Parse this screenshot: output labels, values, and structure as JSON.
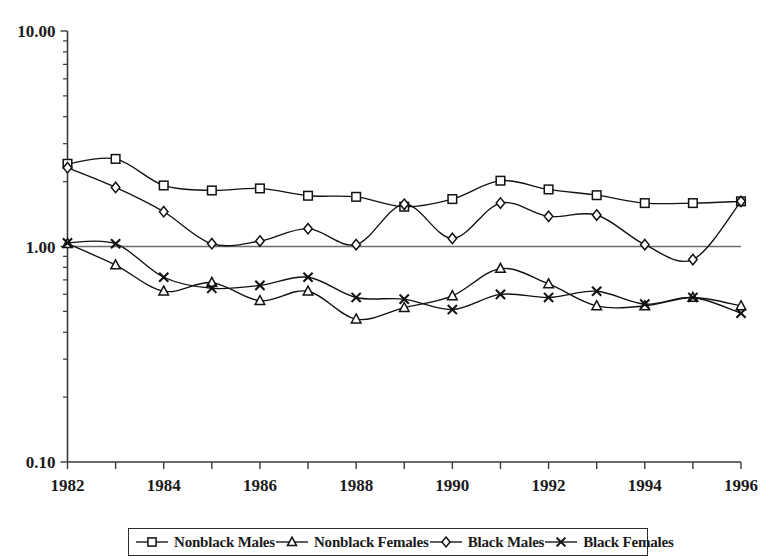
{
  "chart_data": {
    "type": "line",
    "title": "",
    "subtitle": "",
    "xlabel": "",
    "ylabel": "",
    "yscale": "log",
    "ylim": [
      0.1,
      10.0
    ],
    "ytick_labels": [
      "10.00",
      "1.00",
      "0.10"
    ],
    "ytick_values": [
      10.0,
      1.0,
      0.1
    ],
    "grid": false,
    "reference_line": 1.0,
    "legend_position": "bottom",
    "x": [
      1982,
      1983,
      1984,
      1985,
      1986,
      1987,
      1988,
      1989,
      1990,
      1991,
      1992,
      1993,
      1994,
      1995,
      1996
    ],
    "xtick_labels": [
      "1982",
      "1984",
      "1986",
      "1988",
      "1990",
      "1992",
      "1994",
      "1996"
    ],
    "xtick_values": [
      1982,
      1984,
      1986,
      1988,
      1990,
      1992,
      1994,
      1996
    ],
    "xlim": [
      1982,
      1996
    ],
    "series": [
      {
        "name": "Nonblack Males",
        "marker": "square",
        "values": [
          2.42,
          2.55,
          1.92,
          1.82,
          1.86,
          1.72,
          1.7,
          1.53,
          1.66,
          2.02,
          1.84,
          1.73,
          1.59,
          1.59,
          1.62
        ]
      },
      {
        "name": "Nonblack Females",
        "marker": "triangle",
        "values": [
          1.03,
          0.82,
          0.62,
          0.68,
          0.56,
          0.62,
          0.46,
          0.52,
          0.59,
          0.79,
          0.67,
          0.53,
          0.53,
          0.58,
          0.53
        ]
      },
      {
        "name": "Black Males",
        "marker": "diamond",
        "values": [
          2.32,
          1.88,
          1.45,
          1.03,
          1.06,
          1.21,
          1.02,
          1.57,
          1.09,
          1.59,
          1.38,
          1.4,
          1.02,
          0.87,
          1.62
        ]
      },
      {
        "name": "Black Females",
        "marker": "cross",
        "values": [
          1.04,
          1.03,
          0.72,
          0.64,
          0.66,
          0.72,
          0.58,
          0.57,
          0.51,
          0.6,
          0.58,
          0.62,
          0.54,
          0.58,
          0.49
        ]
      }
    ]
  },
  "legend": {
    "items": [
      {
        "label": "Nonblack Males",
        "marker": "square"
      },
      {
        "label": "Nonblack Females",
        "marker": "triangle"
      },
      {
        "label": "Black Males",
        "marker": "diamond"
      },
      {
        "label": "Black Females",
        "marker": "cross"
      }
    ]
  },
  "colors": {
    "line": "#111111",
    "axis": "#3a3a3a",
    "reference": "#6b6b6b",
    "marker_fill": "#ffffff",
    "background": "#ffffff"
  }
}
